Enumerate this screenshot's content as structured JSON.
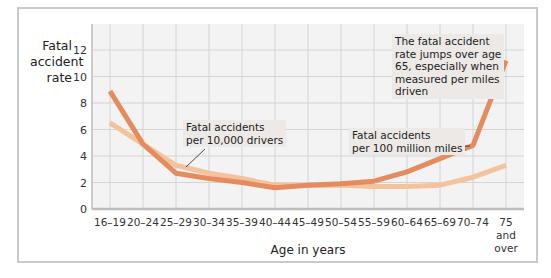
{
  "chart_data": {
    "type": "line",
    "title": "",
    "xlabel": "Age in years",
    "ylabel": "Fatal accident rate",
    "ylim": [
      0,
      14
    ],
    "yticks": [
      0,
      2,
      4,
      6,
      8,
      10,
      12
    ],
    "grid": true,
    "categories": [
      "16–19",
      "20–24",
      "25–29",
      "30–34",
      "35–39",
      "40–44",
      "45–49",
      "50–54",
      "55–59",
      "60–64",
      "65–69",
      "70–74",
      "75 and over"
    ],
    "series": [
      {
        "name": "Fatal accidents per 100 million miles",
        "color": "#e48c5e",
        "values": [
          8.9,
          4.9,
          2.7,
          2.3,
          2.0,
          1.6,
          1.8,
          1.9,
          2.1,
          2.8,
          3.8,
          4.8,
          11.2
        ]
      },
      {
        "name": "Fatal accidents per 10,000 drivers",
        "color": "#f5c29e",
        "values": [
          6.5,
          4.9,
          3.3,
          2.7,
          2.3,
          1.8,
          1.8,
          1.8,
          1.7,
          1.7,
          1.8,
          2.4,
          3.3
        ]
      }
    ],
    "annotations": [
      "Fatal accidents per 10,000 drivers",
      "Fatal accidents per 100 million miles",
      "The fatal accident rate jumps over age 65, especially when measured per miles driven"
    ]
  },
  "ylabel_lines": [
    "Fatal",
    "accident",
    "rate"
  ],
  "xlabel": "Age in years",
  "notes": {
    "drivers": [
      "Fatal accidents",
      "per 10,000 drivers"
    ],
    "miles": [
      "Fatal accidents",
      "per 100 million miles"
    ],
    "jump": [
      "The fatal accident",
      "rate jumps over age",
      "65, especially when",
      "measured per miles",
      "driven"
    ]
  },
  "last_cat_lines": [
    "75",
    "and",
    "over"
  ]
}
